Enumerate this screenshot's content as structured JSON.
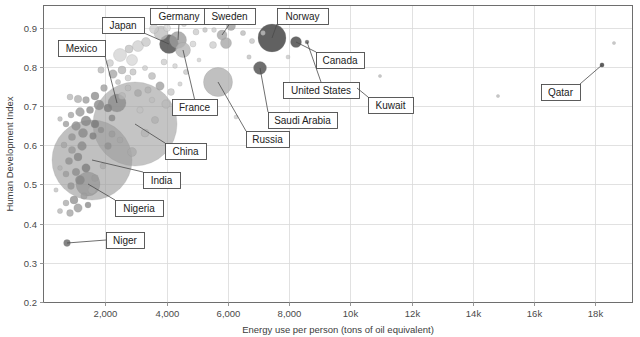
{
  "chart_data": {
    "type": "scatter",
    "title": "",
    "xlabel": "Energy use per person (tons of oil equivalent)",
    "ylabel": "Human Development Index",
    "xlim": [
      0,
      19200
    ],
    "ylim": [
      0.2,
      0.955
    ],
    "grid": true,
    "legend": "none",
    "bubble_note": "Bubble area encodes population; grayscale fill with transparency",
    "xticks": [
      {
        "value": 2000,
        "label": "2,000"
      },
      {
        "value": 4000,
        "label": "4,000"
      },
      {
        "value": 6000,
        "label": "6,000"
      },
      {
        "value": 8000,
        "label": "8,000"
      },
      {
        "value": 10000,
        "label": "10k"
      },
      {
        "value": 12000,
        "label": "12k"
      },
      {
        "value": 14000,
        "label": "14k"
      },
      {
        "value": 16000,
        "label": "16k"
      },
      {
        "value": 18000,
        "label": "18k"
      }
    ],
    "yticks": [
      {
        "value": 0.2,
        "label": "0.2"
      },
      {
        "value": 0.3,
        "label": "0.3"
      },
      {
        "value": 0.4,
        "label": "0.4"
      },
      {
        "value": 0.5,
        "label": "0.5"
      },
      {
        "value": 0.6,
        "label": "0.6"
      },
      {
        "value": 0.7,
        "label": "0.7"
      },
      {
        "value": 0.8,
        "label": "0.8"
      },
      {
        "value": 0.9,
        "label": "0.9"
      }
    ],
    "annotations": [
      {
        "name": "Mexico",
        "box_x": 58,
        "box_y": 40,
        "box_w": 47,
        "box_h": 16,
        "point_x": 117,
        "point_y": 103
      },
      {
        "name": "Japan",
        "box_x": 102,
        "box_y": 17,
        "box_w": 42,
        "box_h": 16,
        "point_x": 169,
        "point_y": 44
      },
      {
        "name": "Germany",
        "box_x": 150,
        "box_y": 8,
        "box_w": 58,
        "box_h": 16,
        "point_x": 178,
        "point_y": 40
      },
      {
        "name": "Sweden",
        "box_x": 204,
        "box_y": 8,
        "box_w": 51,
        "box_h": 16,
        "point_x": 222,
        "point_y": 35
      },
      {
        "name": "Norway",
        "box_x": 277,
        "box_y": 8,
        "box_w": 51,
        "box_h": 16,
        "point_x": 272,
        "point_y": 38
      },
      {
        "name": "Canada",
        "box_x": 316,
        "box_y": 52,
        "box_w": 48,
        "box_h": 16,
        "point_x": 296,
        "point_y": 42
      },
      {
        "name": "France",
        "box_x": 172,
        "box_y": 99,
        "box_w": 45,
        "box_h": 16,
        "point_x": 183,
        "point_y": 50
      },
      {
        "name": "United States",
        "box_x": 283,
        "box_y": 82,
        "box_w": 76,
        "box_h": 16,
        "point_x": 307,
        "point_y": 42
      },
      {
        "name": "Kuwait",
        "box_x": 368,
        "box_y": 97,
        "box_w": 45,
        "box_h": 16,
        "point_x": 357,
        "point_y": 88
      },
      {
        "name": "Qatar",
        "box_x": 541,
        "box_y": 84,
        "box_w": 39,
        "box_h": 16,
        "point_x": 602,
        "point_y": 65
      },
      {
        "name": "Saudi Arabia",
        "box_x": 268,
        "box_y": 112,
        "box_w": 69,
        "box_h": 16,
        "point_x": 260,
        "point_y": 68
      },
      {
        "name": "Russia",
        "box_x": 246,
        "box_y": 131,
        "box_w": 43,
        "box_h": 16,
        "point_x": 218,
        "point_y": 82
      },
      {
        "name": "China",
        "box_x": 165,
        "box_y": 143,
        "box_w": 41,
        "box_h": 16,
        "point_x": 135,
        "point_y": 124
      },
      {
        "name": "India",
        "box_x": 143,
        "box_y": 172,
        "box_w": 37,
        "box_h": 16,
        "point_x": 92,
        "point_y": 160
      },
      {
        "name": "Nigeria",
        "box_x": 115,
        "box_y": 200,
        "box_w": 48,
        "box_h": 16,
        "point_x": 88,
        "point_y": 184
      },
      {
        "name": "Niger",
        "box_x": 106,
        "box_y": 232,
        "box_w": 38,
        "box_h": 16,
        "point_x": 67,
        "point_y": 243
      }
    ],
    "points": [
      {
        "x": 67,
        "y": 243,
        "r": 3.4,
        "fill": "#7d7d7d",
        "a": 0.95
      },
      {
        "x": 92,
        "y": 160,
        "r": 40,
        "fill": "#9a9a9a",
        "a": 0.62
      },
      {
        "x": 135,
        "y": 124,
        "r": 42,
        "fill": "#a0a0a0",
        "a": 0.62
      },
      {
        "x": 88,
        "y": 184,
        "r": 12,
        "fill": "#949494",
        "a": 0.72
      },
      {
        "x": 117,
        "y": 103,
        "r": 9,
        "fill": "#8a8a8a",
        "a": 0.78
      },
      {
        "x": 169,
        "y": 44,
        "r": 9.5,
        "fill": "#5e5e5e",
        "a": 0.92
      },
      {
        "x": 178,
        "y": 40,
        "r": 8.5,
        "fill": "#9c9c9c",
        "a": 0.8
      },
      {
        "x": 183,
        "y": 50,
        "r": 7.5,
        "fill": "#b4b4b4",
        "a": 0.8
      },
      {
        "x": 222,
        "y": 35,
        "r": 5,
        "fill": "#a8a8a8",
        "a": 0.82
      },
      {
        "x": 218,
        "y": 82,
        "r": 14.5,
        "fill": "#b0b0b0",
        "a": 0.8
      },
      {
        "x": 260,
        "y": 68,
        "r": 6.5,
        "fill": "#636363",
        "a": 0.92
      },
      {
        "x": 272,
        "y": 38,
        "r": 14,
        "fill": "#555555",
        "a": 0.93
      },
      {
        "x": 296,
        "y": 42,
        "r": 5.5,
        "fill": "#5c5c5c",
        "a": 0.93
      },
      {
        "x": 307,
        "y": 42,
        "r": 2.0,
        "fill": "#6a6a6a",
        "a": 0.9
      },
      {
        "x": 357,
        "y": 88,
        "r": 1.8,
        "fill": "#6a6a6a",
        "a": 0.9
      },
      {
        "x": 602,
        "y": 65,
        "r": 2.2,
        "fill": "#555555",
        "a": 0.95
      },
      {
        "x": 614,
        "y": 43,
        "r": 1.6,
        "fill": "#bfbfbf",
        "a": 0.85
      },
      {
        "x": 498,
        "y": 96,
        "r": 1.6,
        "fill": "#bdbdbd",
        "a": 0.85
      },
      {
        "x": 380,
        "y": 76,
        "r": 1.6,
        "fill": "#bdbdbd",
        "a": 0.85
      },
      {
        "x": 154,
        "y": 29,
        "r": 4.5,
        "fill": "#c9c9c9",
        "a": 0.7
      },
      {
        "x": 161,
        "y": 33,
        "r": 7,
        "fill": "#b9b9b9",
        "a": 0.75
      },
      {
        "x": 167,
        "y": 28,
        "r": 3.5,
        "fill": "#d4d4d4",
        "a": 0.7
      },
      {
        "x": 196,
        "y": 32,
        "r": 3,
        "fill": "#c4c4c4",
        "a": 0.7
      },
      {
        "x": 205,
        "y": 30,
        "r": 2.4,
        "fill": "#bbbbbb",
        "a": 0.7
      },
      {
        "x": 214,
        "y": 30,
        "r": 2.4,
        "fill": "#c6c6c6",
        "a": 0.7
      },
      {
        "x": 231,
        "y": 26,
        "r": 4.5,
        "fill": "#9f9f9f",
        "a": 0.8
      },
      {
        "x": 243,
        "y": 33,
        "r": 2.6,
        "fill": "#b7b7b7",
        "a": 0.75
      },
      {
        "x": 252,
        "y": 41,
        "r": 2.6,
        "fill": "#c2c2c2",
        "a": 0.75
      },
      {
        "x": 226,
        "y": 43,
        "r": 5.5,
        "fill": "#a5a5a5",
        "a": 0.78
      },
      {
        "x": 213,
        "y": 45,
        "r": 3.5,
        "fill": "#c9c9c9",
        "a": 0.72
      },
      {
        "x": 193,
        "y": 44,
        "r": 3.0,
        "fill": "#cfcfcf",
        "a": 0.72
      },
      {
        "x": 146,
        "y": 42,
        "r": 4.5,
        "fill": "#c2c2c2",
        "a": 0.72
      },
      {
        "x": 138,
        "y": 46,
        "r": 5.5,
        "fill": "#cacaca",
        "a": 0.7
      },
      {
        "x": 129,
        "y": 49,
        "r": 4.0,
        "fill": "#bdbdbd",
        "a": 0.72
      },
      {
        "x": 120,
        "y": 55,
        "r": 6.5,
        "fill": "#cdcdcd",
        "a": 0.68
      },
      {
        "x": 132,
        "y": 60,
        "r": 5.5,
        "fill": "#d2d2d2",
        "a": 0.68
      },
      {
        "x": 110,
        "y": 63,
        "r": 3.5,
        "fill": "#c6c6c6",
        "a": 0.7
      },
      {
        "x": 101,
        "y": 70,
        "r": 3.2,
        "fill": "#b4b4b4",
        "a": 0.75
      },
      {
        "x": 113,
        "y": 74,
        "r": 4.2,
        "fill": "#a7a7a7",
        "a": 0.78
      },
      {
        "x": 122,
        "y": 70,
        "r": 4.0,
        "fill": "#b1b1b1",
        "a": 0.75
      },
      {
        "x": 133,
        "y": 72,
        "r": 3.2,
        "fill": "#bdbdbd",
        "a": 0.72
      },
      {
        "x": 145,
        "y": 68,
        "r": 2.6,
        "fill": "#c8c8c8",
        "a": 0.7
      },
      {
        "x": 152,
        "y": 76,
        "r": 3.6,
        "fill": "#b6b6b6",
        "a": 0.74
      },
      {
        "x": 164,
        "y": 62,
        "r": 3.0,
        "fill": "#c6c6c6",
        "a": 0.7
      },
      {
        "x": 175,
        "y": 66,
        "r": 2.4,
        "fill": "#cccccc",
        "a": 0.7
      },
      {
        "x": 186,
        "y": 72,
        "r": 2.6,
        "fill": "#c0c0c0",
        "a": 0.7
      },
      {
        "x": 160,
        "y": 86,
        "r": 4.2,
        "fill": "#9d9d9d",
        "a": 0.78
      },
      {
        "x": 148,
        "y": 90,
        "r": 3.2,
        "fill": "#b0b0b0",
        "a": 0.74
      },
      {
        "x": 138,
        "y": 93,
        "r": 3.6,
        "fill": "#a6a6a6",
        "a": 0.76
      },
      {
        "x": 128,
        "y": 88,
        "r": 3.0,
        "fill": "#b8b8b8",
        "a": 0.72
      },
      {
        "x": 104,
        "y": 88,
        "r": 3.4,
        "fill": "#9e9e9e",
        "a": 0.78
      },
      {
        "x": 95,
        "y": 96,
        "r": 4.0,
        "fill": "#8f8f8f",
        "a": 0.8
      },
      {
        "x": 86,
        "y": 100,
        "r": 3.4,
        "fill": "#9b9b9b",
        "a": 0.78
      },
      {
        "x": 78,
        "y": 99,
        "r": 3.8,
        "fill": "#a9a9a9",
        "a": 0.75
      },
      {
        "x": 70,
        "y": 97,
        "r": 3.0,
        "fill": "#b4b4b4",
        "a": 0.74
      },
      {
        "x": 99,
        "y": 105,
        "r": 5.0,
        "fill": "#8a8a8a",
        "a": 0.8
      },
      {
        "x": 108,
        "y": 108,
        "r": 4.0,
        "fill": "#7e7e7e",
        "a": 0.82
      },
      {
        "x": 90,
        "y": 110,
        "r": 3.6,
        "fill": "#8c8c8c",
        "a": 0.8
      },
      {
        "x": 80,
        "y": 112,
        "r": 4.4,
        "fill": "#969696",
        "a": 0.78
      },
      {
        "x": 71,
        "y": 115,
        "r": 3.0,
        "fill": "#a2a2a2",
        "a": 0.76
      },
      {
        "x": 86,
        "y": 121,
        "r": 5.0,
        "fill": "#858585",
        "a": 0.8
      },
      {
        "x": 95,
        "y": 124,
        "r": 4.0,
        "fill": "#7a7a7a",
        "a": 0.82
      },
      {
        "x": 76,
        "y": 126,
        "r": 4.4,
        "fill": "#8e8e8e",
        "a": 0.8
      },
      {
        "x": 66,
        "y": 124,
        "r": 3.0,
        "fill": "#9b9b9b",
        "a": 0.78
      },
      {
        "x": 83,
        "y": 133,
        "r": 4.6,
        "fill": "#888888",
        "a": 0.8
      },
      {
        "x": 93,
        "y": 136,
        "r": 3.4,
        "fill": "#7f7f7f",
        "a": 0.82
      },
      {
        "x": 72,
        "y": 137,
        "r": 3.6,
        "fill": "#949494",
        "a": 0.78
      },
      {
        "x": 101,
        "y": 130,
        "r": 3.0,
        "fill": "#8d8d8d",
        "a": 0.8
      },
      {
        "x": 112,
        "y": 134,
        "r": 3.2,
        "fill": "#9a9a9a",
        "a": 0.76
      },
      {
        "x": 120,
        "y": 140,
        "r": 3.0,
        "fill": "#a4a4a4",
        "a": 0.74
      },
      {
        "x": 108,
        "y": 146,
        "r": 3.4,
        "fill": "#8f8f8f",
        "a": 0.78
      },
      {
        "x": 132,
        "y": 152,
        "r": 4.5,
        "fill": "#a8a8a8",
        "a": 0.74
      },
      {
        "x": 145,
        "y": 133,
        "r": 4.0,
        "fill": "#b2b2b2",
        "a": 0.72
      },
      {
        "x": 155,
        "y": 120,
        "r": 3.6,
        "fill": "#aeaeae",
        "a": 0.74
      },
      {
        "x": 166,
        "y": 104,
        "r": 4.2,
        "fill": "#b8b8b8",
        "a": 0.72
      },
      {
        "x": 171,
        "y": 92,
        "r": 3.4,
        "fill": "#c0c0c0",
        "a": 0.7
      },
      {
        "x": 82,
        "y": 146,
        "r": 4.4,
        "fill": "#8a8a8a",
        "a": 0.8
      },
      {
        "x": 72,
        "y": 150,
        "r": 3.6,
        "fill": "#979797",
        "a": 0.78
      },
      {
        "x": 64,
        "y": 145,
        "r": 3.0,
        "fill": "#a3a3a3",
        "a": 0.76
      },
      {
        "x": 78,
        "y": 157,
        "r": 4.0,
        "fill": "#848484",
        "a": 0.8
      },
      {
        "x": 69,
        "y": 161,
        "r": 3.6,
        "fill": "#909090",
        "a": 0.78
      },
      {
        "x": 86,
        "y": 168,
        "r": 4.2,
        "fill": "#7f7f7f",
        "a": 0.82
      },
      {
        "x": 76,
        "y": 172,
        "r": 3.8,
        "fill": "#8c8c8c",
        "a": 0.8
      },
      {
        "x": 66,
        "y": 174,
        "r": 3.0,
        "fill": "#9b9b9b",
        "a": 0.78
      },
      {
        "x": 80,
        "y": 180,
        "r": 4.6,
        "fill": "#868686",
        "a": 0.8
      },
      {
        "x": 71,
        "y": 186,
        "r": 3.4,
        "fill": "#939393",
        "a": 0.78
      },
      {
        "x": 92,
        "y": 190,
        "r": 4.0,
        "fill": "#aaaaaa",
        "a": 0.74
      },
      {
        "x": 84,
        "y": 196,
        "r": 3.2,
        "fill": "#9e9e9e",
        "a": 0.76
      },
      {
        "x": 74,
        "y": 200,
        "r": 4.0,
        "fill": "#8f8f8f",
        "a": 0.78
      },
      {
        "x": 66,
        "y": 203,
        "r": 3.0,
        "fill": "#a6a6a6",
        "a": 0.74
      },
      {
        "x": 78,
        "y": 208,
        "r": 4.2,
        "fill": "#999999",
        "a": 0.76
      },
      {
        "x": 70,
        "y": 213,
        "r": 3.4,
        "fill": "#a0a0a0",
        "a": 0.75
      },
      {
        "x": 60,
        "y": 211,
        "r": 2.6,
        "fill": "#b0b0b0",
        "a": 0.72
      },
      {
        "x": 88,
        "y": 205,
        "r": 3.0,
        "fill": "#8b8b8b",
        "a": 0.78
      },
      {
        "x": 95,
        "y": 178,
        "r": 3.4,
        "fill": "#9d9d9d",
        "a": 0.76
      },
      {
        "x": 103,
        "y": 166,
        "r": 3.0,
        "fill": "#a9a9a9",
        "a": 0.74
      },
      {
        "x": 112,
        "y": 118,
        "r": 3.2,
        "fill": "#888888",
        "a": 0.8
      },
      {
        "x": 122,
        "y": 96,
        "r": 3.6,
        "fill": "#b6b6b6",
        "a": 0.72
      },
      {
        "x": 140,
        "y": 110,
        "r": 3.2,
        "fill": "#c1c1c1",
        "a": 0.7
      },
      {
        "x": 152,
        "y": 100,
        "r": 2.8,
        "fill": "#bcbcbc",
        "a": 0.7
      },
      {
        "x": 128,
        "y": 78,
        "r": 3.0,
        "fill": "#c4c4c4",
        "a": 0.7
      },
      {
        "x": 118,
        "y": 82,
        "r": 2.6,
        "fill": "#b9b9b9",
        "a": 0.72
      },
      {
        "x": 180,
        "y": 84,
        "r": 2.2,
        "fill": "#c9c9c9",
        "a": 0.7
      },
      {
        "x": 199,
        "y": 60,
        "r": 2.0,
        "fill": "#cacaca",
        "a": 0.7
      },
      {
        "x": 208,
        "y": 108,
        "r": 2.2,
        "fill": "#c2c2c2",
        "a": 0.7
      },
      {
        "x": 236,
        "y": 117,
        "r": 2.0,
        "fill": "#c6c6c6",
        "a": 0.7
      },
      {
        "x": 249,
        "y": 57,
        "r": 2.2,
        "fill": "#bbbbbb",
        "a": 0.72
      },
      {
        "x": 288,
        "y": 57,
        "r": 2.0,
        "fill": "#c0c0c0",
        "a": 0.7
      },
      {
        "x": 263,
        "y": 33,
        "r": 2.4,
        "fill": "#cdcdcd",
        "a": 0.7
      },
      {
        "x": 248,
        "y": 22,
        "r": 2.8,
        "fill": "#c4c4c4",
        "a": 0.7
      },
      {
        "x": 238,
        "y": 18,
        "r": 3.0,
        "fill": "#b6b6b6",
        "a": 0.72
      },
      {
        "x": 184,
        "y": 24,
        "r": 2.6,
        "fill": "#c8c8c8",
        "a": 0.7
      },
      {
        "x": 172,
        "y": 21,
        "r": 2.4,
        "fill": "#d0d0d0",
        "a": 0.68
      },
      {
        "x": 60,
        "y": 119,
        "r": 2.4,
        "fill": "#b4b4b4",
        "a": 0.74
      },
      {
        "x": 56,
        "y": 190,
        "r": 2.2,
        "fill": "#bcbcbc",
        "a": 0.72
      },
      {
        "x": 60,
        "y": 168,
        "r": 2.4,
        "fill": "#b0b0b0",
        "a": 0.74
      }
    ]
  }
}
